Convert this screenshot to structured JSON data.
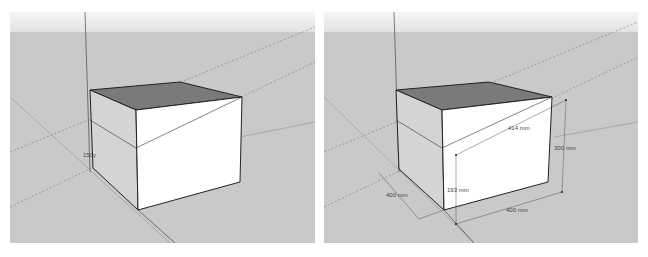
{
  "colors": {
    "ground": "#c9c9c9",
    "sky_top": "#f6f6f6",
    "sky_bottom": "#e2e2e2",
    "top_face": "#7a7a7a",
    "front_face": "#ffffff",
    "edge": "#222222"
  },
  "left_view": {
    "label": "150y"
  },
  "right_view": {
    "dimensions": {
      "diagonal": "414 mm",
      "height_right": "300 mm",
      "height_inner": "193 mm",
      "depth": "400 mm",
      "width": "400 mm"
    }
  }
}
